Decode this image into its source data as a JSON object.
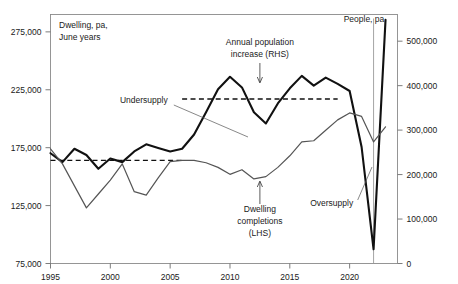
{
  "chart_data": {
    "type": "line",
    "title": "",
    "subtitle": "",
    "xlabel": "",
    "ylabel": "Dwelling, pa, June years",
    "y2label": "People, pa",
    "left_axis": {
      "label": "Dwelling, pa,\nJune years",
      "label_line1": "Dwelling, pa,",
      "label_line2": "June years",
      "ticks": [
        "75,000",
        "125,000",
        "175,000",
        "225,000",
        "275,000"
      ],
      "tick_values": [
        75000,
        125000,
        175000,
        225000,
        275000
      ],
      "ylim": [
        75000,
        290000
      ]
    },
    "right_axis": {
      "label": "People, pa",
      "ticks": [
        "0",
        "100,000",
        "200,000",
        "300,000",
        "400,000",
        "500,000"
      ],
      "tick_values": [
        0,
        100000,
        200000,
        300000,
        400000,
        500000
      ],
      "ylim": [
        0,
        560000
      ]
    },
    "x_axis": {
      "ticks": [
        "1995",
        "2000",
        "2005",
        "2010",
        "2015",
        "2020"
      ],
      "tick_values": [
        1995,
        2000,
        2005,
        2010,
        2015,
        2020
      ],
      "xlim": [
        1995,
        2024
      ]
    },
    "grid": false,
    "legend": "annotations",
    "x": [
      1995,
      1996,
      1997,
      1998,
      1999,
      2000,
      2001,
      2002,
      2003,
      2004,
      2005,
      2006,
      2007,
      2008,
      2009,
      2010,
      2011,
      2012,
      2013,
      2014,
      2015,
      2016,
      2017,
      2018,
      2019,
      2020,
      2021,
      2022,
      2023
    ],
    "series": [
      {
        "name": "Annual population increase (RHS)",
        "axis": "right",
        "color": "#111111",
        "style": "solid-thick",
        "values": [
          248000,
          228000,
          258000,
          244000,
          213000,
          236000,
          228000,
          252000,
          268000,
          260000,
          252000,
          258000,
          290000,
          340000,
          392000,
          420000,
          396000,
          340000,
          315000,
          360000,
          394000,
          422000,
          400000,
          418000,
          404000,
          388000,
          262000,
          32000,
          548000
        ]
      },
      {
        "name": "Dwelling completions (LHS)",
        "axis": "left",
        "color": "#555555",
        "style": "solid-thin",
        "values": [
          174000,
          161000,
          142000,
          123000,
          135000,
          147000,
          161000,
          137000,
          134000,
          149000,
          163000,
          164000,
          164000,
          162000,
          158000,
          152000,
          156000,
          148000,
          150000,
          158000,
          168000,
          180000,
          181000,
          190000,
          199000,
          205000,
          202000,
          180000,
          193000
        ]
      }
    ],
    "reference_lines": [
      {
        "name": "population-average",
        "axis": "right",
        "value": 370000,
        "style": "dashed",
        "x_start": 2006,
        "x_end": 2019
      },
      {
        "name": "completions-average",
        "axis": "left",
        "value": 164000,
        "style": "dashed",
        "x_start": 1995,
        "x_end": 2006
      }
    ],
    "vertical_markers": [
      {
        "name": "period-divider",
        "value": 2022
      }
    ],
    "annotations": [
      {
        "name": "undersupply",
        "text": "Undersupply",
        "x": 2002.8,
        "y_px": 103,
        "leader": true
      },
      {
        "name": "annual-population-increase",
        "text_line1": "Annual population",
        "text_line2": "increase (RHS)",
        "x": 2012.5,
        "y_px": 45,
        "arrow": "down"
      },
      {
        "name": "dwelling-completions",
        "text_line1": "Dwelling",
        "text_line2": "completions",
        "text_line3": "(LHS)",
        "x": 2012.5,
        "y_px": 212,
        "arrow": "up"
      },
      {
        "name": "oversupply",
        "text": "Oversupply",
        "x": 2018.5,
        "y_px": 206,
        "leader": true
      },
      {
        "name": "people-pa",
        "text": "People, pa",
        "x": 2021.2,
        "y_px": 22
      }
    ]
  },
  "colors": {
    "population_line": "#111111",
    "completions_line": "#555555",
    "frame": "#8a8a8a",
    "text": "#1a1a1a",
    "background": "#ffffff"
  }
}
